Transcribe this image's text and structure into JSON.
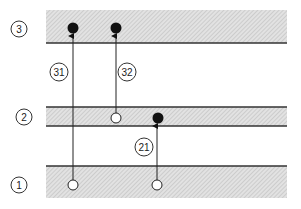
{
  "diagram": {
    "type": "energy-level-transition-diagram",
    "levels": [
      {
        "id": "3",
        "label": "3",
        "band": {
          "y": 10,
          "h": 33
        },
        "lines": [
          "bottom"
        ]
      },
      {
        "id": "2",
        "label": "2",
        "band": {
          "y": 107,
          "h": 19
        },
        "lines": [
          "top",
          "bottom"
        ]
      },
      {
        "id": "1",
        "label": "1",
        "band": {
          "y": 166,
          "h": 32
        },
        "lines": [
          "top"
        ]
      }
    ],
    "transitions": [
      {
        "id": "31",
        "label": "31",
        "from_level": "1",
        "to_level": "3"
      },
      {
        "id": "32",
        "label": "32",
        "from_level": "2",
        "to_level": "3"
      },
      {
        "id": "21",
        "label": "21",
        "from_level": "1",
        "to_level": "2"
      }
    ],
    "markers": {
      "filled": "occupied state (final)",
      "open": "vacated state (initial)"
    },
    "colors": {
      "band_fill": "#d6d6d6",
      "line": "#333333",
      "dot": "#111111",
      "background": "#ffffff"
    }
  }
}
